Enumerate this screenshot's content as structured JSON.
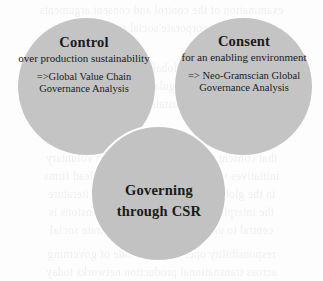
{
  "diagram": {
    "type": "venn",
    "fill_color": "#c4c4c4",
    "outline_color": "#ffffff",
    "background_color": "#fdfdfd",
    "text_color": "#1a1a1a",
    "sets": [
      {
        "id": "control",
        "heading": "Control",
        "subtitle": "over production sustainability",
        "note": "=>Global Value Chain Governance Analysis",
        "position": "top-left"
      },
      {
        "id": "consent",
        "heading": "Consent",
        "subtitle": "for an enabling environment",
        "note": "=> Neo-Gramscian Global Governance Analysis",
        "position": "top-right"
      },
      {
        "id": "governing",
        "heading": "Governing through CSR",
        "subtitle": "",
        "note": "",
        "position": "bottom-center"
      }
    ]
  },
  "background_bleed": {
    "lines": [
      "examination of the control and consent arguments",
      "underlying corporate social responsibility",
      "the governance of global value chains and the",
      "role of private regulation in production",
      "approaches to sustainability standards",
      "a neo-Gramscian reading of hegemony suggests",
      "that consent is manufactured through voluntary",
      "initiatives while control remains with lead firms",
      "in the global value chain governance literature",
      "the interplay between these two dimensions is",
      "central to understanding how corporate social",
      "responsibility operates as a mode of governing",
      "across transnational production networks today"
    ]
  }
}
